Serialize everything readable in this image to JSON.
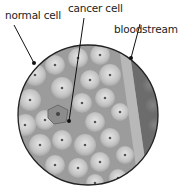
{
  "labels": {
    "normal_cell": "normal cell",
    "cancer_cell": "cancer cell",
    "bloodstream": "bloodstream"
  },
  "colors": {
    "cell_light": "#d8d8d8",
    "cell_mid": "#b4b4b4",
    "background": "#9a9a9a",
    "bloodstream": "#6e6e6e",
    "nucleus": "#555555",
    "leader": "#111111"
  }
}
